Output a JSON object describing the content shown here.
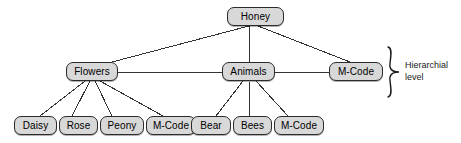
{
  "diagram": {
    "type": "tree",
    "colors": {
      "node_fill": "#d8d8d8",
      "node_border": "#2b2b2b",
      "edge": "#333333",
      "text": "#000000",
      "background": "#ffffff"
    },
    "nodes": [
      {
        "id": "honey",
        "label": "Honey",
        "level": 0,
        "x": 227,
        "y": 7,
        "w": 57,
        "h": 19
      },
      {
        "id": "flowers",
        "label": "Flowers",
        "level": 1,
        "x": 66,
        "y": 62,
        "w": 52,
        "h": 19
      },
      {
        "id": "animals",
        "label": "Animals",
        "level": 1,
        "x": 222,
        "y": 62,
        "w": 53,
        "h": 19
      },
      {
        "id": "mcode-top",
        "label": "M-Code",
        "level": 1,
        "x": 329,
        "y": 62,
        "w": 54,
        "h": 19
      },
      {
        "id": "daisy",
        "label": "Daisy",
        "level": 2,
        "x": 14,
        "y": 116,
        "w": 43,
        "h": 19
      },
      {
        "id": "rose",
        "label": "Rose",
        "level": 2,
        "x": 59,
        "y": 116,
        "w": 39,
        "h": 19
      },
      {
        "id": "peony",
        "label": "Peony",
        "level": 2,
        "x": 100,
        "y": 116,
        "w": 44,
        "h": 19
      },
      {
        "id": "mcode-flower",
        "label": "M-Code",
        "level": 2,
        "x": 146,
        "y": 116,
        "w": 50,
        "h": 19
      },
      {
        "id": "bear",
        "label": "Bear",
        "level": 2,
        "x": 191,
        "y": 116,
        "w": 40,
        "h": 19
      },
      {
        "id": "bees",
        "label": "Bees",
        "level": 2,
        "x": 233,
        "y": 116,
        "w": 39,
        "h": 19
      },
      {
        "id": "mcode-animal",
        "label": "M-Code",
        "level": 2,
        "x": 274,
        "y": 116,
        "w": 50,
        "h": 19
      }
    ],
    "edges": [
      {
        "from": "honey",
        "to": "flowers",
        "x1": 249,
        "y1": 26,
        "x2": 112,
        "y2": 62
      },
      {
        "from": "honey",
        "to": "animals",
        "x1": 249,
        "y1": 26,
        "x2": 249,
        "y2": 62
      },
      {
        "from": "honey",
        "to": "mcode-top",
        "x1": 258,
        "y1": 26,
        "x2": 350,
        "y2": 62
      },
      {
        "from": "flowers",
        "to": "animals",
        "x1": 118,
        "y1": 72,
        "x2": 222,
        "y2": 72
      },
      {
        "from": "animals",
        "to": "mcode-top",
        "x1": 275,
        "y1": 72,
        "x2": 329,
        "y2": 72
      },
      {
        "from": "flowers",
        "to": "daisy",
        "x1": 85,
        "y1": 81,
        "x2": 40,
        "y2": 116
      },
      {
        "from": "flowers",
        "to": "rose",
        "x1": 90,
        "y1": 81,
        "x2": 72,
        "y2": 116
      },
      {
        "from": "flowers",
        "to": "peony",
        "x1": 95,
        "y1": 81,
        "x2": 112,
        "y2": 116
      },
      {
        "from": "flowers",
        "to": "mcode-flower",
        "x1": 100,
        "y1": 81,
        "x2": 163,
        "y2": 116
      },
      {
        "from": "animals",
        "to": "bear",
        "x1": 243,
        "y1": 81,
        "x2": 216,
        "y2": 116
      },
      {
        "from": "animals",
        "to": "bees",
        "x1": 249,
        "y1": 81,
        "x2": 250,
        "y2": 116
      },
      {
        "from": "animals",
        "to": "mcode-animal",
        "x1": 256,
        "y1": 81,
        "x2": 288,
        "y2": 116
      }
    ],
    "annotation": {
      "brace_label": "Hierarchial\nlevel",
      "brace": {
        "x": 386,
        "y": 46,
        "w": 14,
        "h": 52
      }
    }
  }
}
